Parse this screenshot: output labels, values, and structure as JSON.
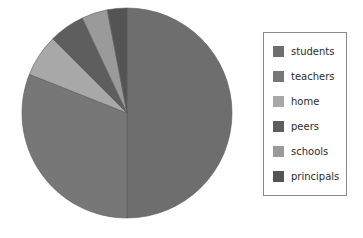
{
  "chart_data": {
    "type": "pie",
    "title": "",
    "categories": [
      "students",
      "teachers",
      "home",
      "peers",
      "schools",
      "principals"
    ],
    "values": [
      50.0,
      31.0,
      6.5,
      5.5,
      4.0,
      3.0
    ],
    "units": "percent",
    "total": 100.0,
    "start_angle_deg": 90,
    "direction": "clockwise",
    "colors": [
      "#6e6e6e",
      "#777777",
      "#a8a8a8",
      "#5e5e5e",
      "#9a9a9a",
      "#545454"
    ],
    "labels_shown": false,
    "grid": false,
    "legend": {
      "position": "right",
      "border_color": "#8a8a8a",
      "entries": [
        {
          "label": "students",
          "color": "#6e6e6e",
          "value": 50.0
        },
        {
          "label": "teachers",
          "color": "#777777",
          "value": 31.0
        },
        {
          "label": "home",
          "color": "#a8a8a8",
          "value": 6.5
        },
        {
          "label": "peers",
          "color": "#5e5e5e",
          "value": 5.5
        },
        {
          "label": "schools",
          "color": "#9a9a9a",
          "value": 4.0
        },
        {
          "label": "principals",
          "color": "#545454",
          "value": 3.0
        }
      ]
    },
    "geometry": {
      "center_x": 127,
      "center_y": 113,
      "radius": 105
    }
  }
}
